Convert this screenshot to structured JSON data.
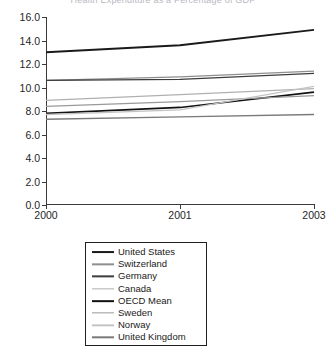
{
  "chart_data": {
    "type": "line",
    "title": "Health Expenditure as a Percentage of GDP",
    "xlabel": "",
    "ylabel": "",
    "x": [
      2000,
      2001,
      2003
    ],
    "x_tick_labels": [
      "2000",
      "2001",
      "2003"
    ],
    "y_tick_labels": [
      "0.0",
      "2.0",
      "4.0",
      "6.0",
      "8.0",
      "10.0",
      "12.0",
      "14.0",
      "16.0"
    ],
    "y_ticks": [
      0,
      2,
      4,
      6,
      8,
      10,
      12,
      14,
      16
    ],
    "ylim": [
      0,
      16
    ],
    "xlim": [
      2000,
      2003
    ],
    "grid": false,
    "legend_position": "below-center",
    "series": [
      {
        "name": "United States",
        "values": [
          13.0,
          13.6,
          14.9
        ],
        "color": "#1a1a1a",
        "width": 1.9
      },
      {
        "name": "Switzerland",
        "values": [
          10.6,
          10.9,
          11.4
        ],
        "color": "#8e8e8e",
        "width": 1.3
      },
      {
        "name": "Germany",
        "values": [
          10.6,
          10.7,
          11.2
        ],
        "color": "#3d3d3d",
        "width": 1.3
      },
      {
        "name": "Canada",
        "values": [
          8.9,
          9.4,
          9.9
        ],
        "color": "#b0b0b0",
        "width": 1.3
      },
      {
        "name": "OECD Mean",
        "values": [
          7.8,
          8.3,
          9.6
        ],
        "color": "#121212",
        "width": 1.7
      },
      {
        "name": "Sweden",
        "values": [
          8.4,
          8.8,
          9.3
        ],
        "color": "#999999",
        "width": 1.3
      },
      {
        "name": "Norway",
        "values": [
          7.7,
          8.1,
          10.1
        ],
        "color": "#c4c4c4",
        "width": 1.3
      },
      {
        "name": "United Kingdom",
        "values": [
          7.3,
          7.5,
          7.7
        ],
        "color": "#7a7a7a",
        "width": 1.4
      }
    ]
  },
  "axes": {
    "y_label_text": "",
    "x_label_text": ""
  }
}
